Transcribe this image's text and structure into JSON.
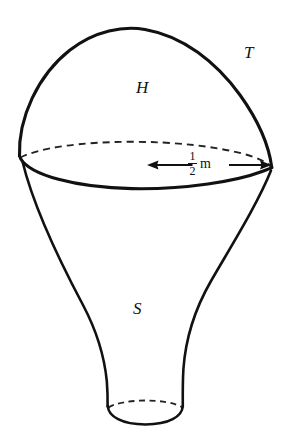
{
  "figure": {
    "background_color": "#ffffff",
    "stroke_color": "#111111",
    "hidden_edge_color": "#222222",
    "labels": {
      "hemisphere": "H",
      "top_surface": "T",
      "stem": "S"
    },
    "dimension": {
      "numerator": "1",
      "denominator": "2",
      "unit": "m",
      "full_text": "1/2 m",
      "arrow_style": "double-headed"
    }
  }
}
